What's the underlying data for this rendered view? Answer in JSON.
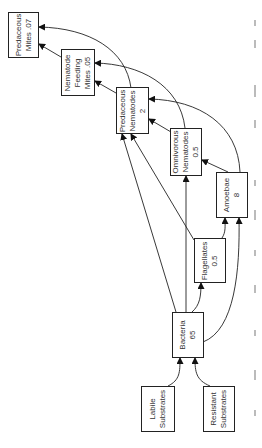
{
  "diagram": {
    "type": "food-web",
    "orientation": "rotated-90-ccw",
    "nodes": [
      {
        "id": "predaceous_mites",
        "lines": [
          "Predaceous",
          "Mites .07"
        ],
        "name": "Predaceous Mites",
        "value": ".07"
      },
      {
        "id": "nematode_feeding_mites",
        "lines": [
          "Nematode",
          "Feeding",
          "Mites .05"
        ],
        "name": "Nematode Feeding Mites",
        "value": ".05"
      },
      {
        "id": "predaceous_nematodes",
        "lines": [
          "Predaceous",
          "Nematodes",
          "2"
        ],
        "name": "Predaceous Nematodes",
        "value": "2"
      },
      {
        "id": "omnivorous_nematodes",
        "lines": [
          "Omnivorous",
          "Nematodes",
          "0.5"
        ],
        "name": "Omnivorous Nematodes",
        "value": "0.5"
      },
      {
        "id": "amoebae",
        "lines": [
          "Amoebae",
          "8"
        ],
        "name": "Amoebae",
        "value": "8"
      },
      {
        "id": "flagellates",
        "lines": [
          "Flagellates",
          "0.5"
        ],
        "name": "Flagellates",
        "value": "0.5"
      },
      {
        "id": "bacteria",
        "lines": [
          "Bacteria",
          "65"
        ],
        "name": "Bacteria",
        "value": "65"
      },
      {
        "id": "labile_substrates",
        "lines": [
          "Labile",
          "Substrates"
        ],
        "name": "Labile Substrates",
        "value": ""
      },
      {
        "id": "resistant_substrates",
        "lines": [
          "Resistant",
          "Substrates"
        ],
        "name": "Resistant Substrates",
        "value": ""
      }
    ],
    "edges": [
      {
        "from": "labile_substrates",
        "to": "bacteria"
      },
      {
        "from": "resistant_substrates",
        "to": "bacteria"
      },
      {
        "from": "bacteria",
        "to": "flagellates"
      },
      {
        "from": "bacteria",
        "to": "amoebae"
      },
      {
        "from": "bacteria",
        "to": "omnivorous_nematodes"
      },
      {
        "from": "bacteria",
        "to": "predaceous_nematodes"
      },
      {
        "from": "flagellates",
        "to": "amoebae"
      },
      {
        "from": "flagellates",
        "to": "predaceous_nematodes"
      },
      {
        "from": "amoebae",
        "to": "omnivorous_nematodes"
      },
      {
        "from": "amoebae",
        "to": "predaceous_nematodes"
      },
      {
        "from": "omnivorous_nematodes",
        "to": "predaceous_nematodes"
      },
      {
        "from": "omnivorous_nematodes",
        "to": "nematode_feeding_mites"
      },
      {
        "from": "predaceous_nematodes",
        "to": "nematode_feeding_mites"
      },
      {
        "from": "predaceous_nematodes",
        "to": "predaceous_mites"
      },
      {
        "from": "nematode_feeding_mites",
        "to": "predaceous_mites"
      }
    ]
  }
}
